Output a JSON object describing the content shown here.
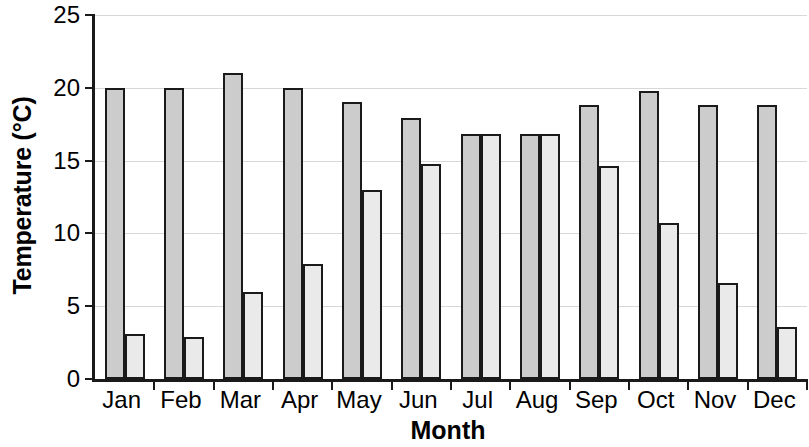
{
  "chart_data": {
    "type": "bar",
    "title": "",
    "xlabel": "Month",
    "ylabel": "Temperature (°C)",
    "categories": [
      "Jan",
      "Feb",
      "Mar",
      "Apr",
      "May",
      "Jun",
      "Jul",
      "Aug",
      "Sep",
      "Oct",
      "Nov",
      "Dec"
    ],
    "series": [
      {
        "name": "series-1",
        "color": "#cccccc",
        "values": [
          20.0,
          20.0,
          21.0,
          20.0,
          19.0,
          17.9,
          16.8,
          16.8,
          18.8,
          19.8,
          18.8,
          18.8
        ]
      },
      {
        "name": "series-2",
        "color": "#eaeaea",
        "values": [
          3.1,
          2.9,
          6.0,
          7.9,
          13.0,
          14.8,
          16.8,
          16.8,
          14.6,
          10.7,
          6.6,
          3.6
        ]
      }
    ],
    "ylim": [
      0,
      25
    ],
    "yticks": [
      0,
      5,
      10,
      15,
      20,
      25
    ],
    "ytick_labels": [
      "0",
      "5",
      "10",
      "15",
      "20",
      "25"
    ],
    "grid": true,
    "legend": "none",
    "bar_border_color": "#1a1a1a",
    "axis_color": "#1a1a1a",
    "gridline_color": "#d8d8d8",
    "background": "#ffffff"
  }
}
